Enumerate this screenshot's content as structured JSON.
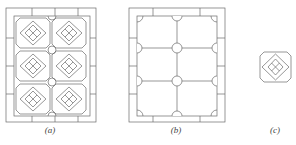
{
  "figure": {
    "panels": [
      {
        "id": "a",
        "label": "(a)",
        "description": "Ceiling grid with 2x3 octagonal coffers containing diamond lattice, circles at intersections"
      },
      {
        "id": "b",
        "label": "(b)",
        "description": "Ceiling grid 2x3 cells with circles and half-circles at beam intersections"
      },
      {
        "id": "c",
        "label": "(c)",
        "description": "Single octagonal coffer tile with diamond lattice"
      }
    ],
    "line_color": "#6a6a6a",
    "background": "#ffffff"
  }
}
